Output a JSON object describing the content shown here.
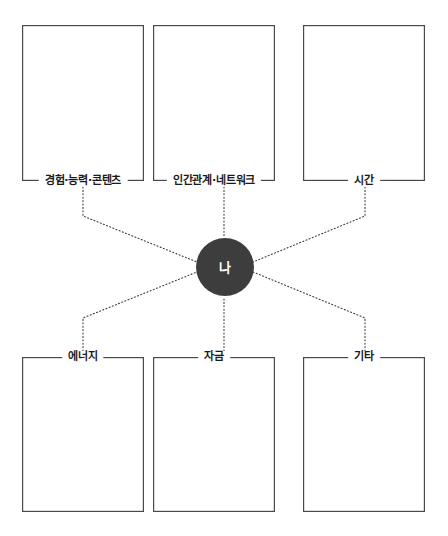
{
  "diagram": {
    "type": "radial-resource-map",
    "center": {
      "label": "나",
      "fill_color": "#3d3d3d",
      "text_color": "#ffffff"
    },
    "connector_style": "dotted",
    "connector_color": "#3b3b3b",
    "box_border_color": "#4a4a4a",
    "background_color": "#ffffff",
    "top_nodes": [
      {
        "label": "경험·능력·콘텐츠",
        "content": ""
      },
      {
        "label": "인간관계·네트워크",
        "content": ""
      },
      {
        "label": "시간",
        "content": ""
      }
    ],
    "bottom_nodes": [
      {
        "label": "에너지",
        "content": ""
      },
      {
        "label": "자금",
        "content": ""
      },
      {
        "label": "기타",
        "content": ""
      }
    ]
  }
}
